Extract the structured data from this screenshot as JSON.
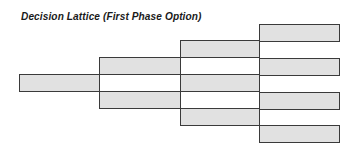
{
  "title": "Decision Lattice (First Phase Option)",
  "colors": {
    "node_fill": "#e1e1e1",
    "node_border": "#3a3a3a",
    "title_text": "#1a1a1a",
    "background": "#ffffff"
  },
  "lattice": {
    "columns": [
      {
        "stage": 1,
        "nodes": [
          {
            "x": 19,
            "y": 74,
            "w": 81,
            "h": 18
          }
        ]
      },
      {
        "stage": 2,
        "nodes": [
          {
            "x": 99,
            "y": 57,
            "w": 82,
            "h": 18
          },
          {
            "x": 99,
            "y": 91,
            "w": 82,
            "h": 18
          }
        ]
      },
      {
        "stage": 3,
        "nodes": [
          {
            "x": 180,
            "y": 40,
            "w": 80,
            "h": 18
          },
          {
            "x": 180,
            "y": 74,
            "w": 80,
            "h": 18
          },
          {
            "x": 180,
            "y": 108,
            "w": 80,
            "h": 18
          }
        ]
      },
      {
        "stage": 4,
        "nodes": [
          {
            "x": 259,
            "y": 24,
            "w": 81,
            "h": 18
          },
          {
            "x": 259,
            "y": 58,
            "w": 81,
            "h": 18
          },
          {
            "x": 259,
            "y": 92,
            "w": 81,
            "h": 18
          },
          {
            "x": 259,
            "y": 125,
            "w": 81,
            "h": 18
          }
        ]
      }
    ]
  }
}
